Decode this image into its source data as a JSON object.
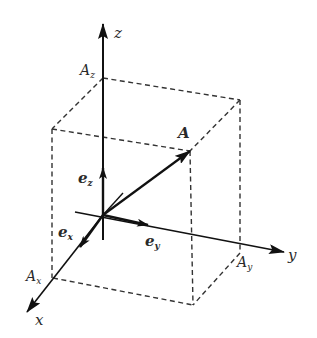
{
  "diagram": {
    "axes": {
      "x": {
        "label": "x"
      },
      "y": {
        "label": "y"
      },
      "z": {
        "label": "z"
      }
    },
    "components": {
      "Ax": {
        "main": "A",
        "sub": "x"
      },
      "Ay": {
        "main": "A",
        "sub": "y"
      },
      "Az": {
        "main": "A",
        "sub": "z"
      }
    },
    "vector": {
      "label": "A"
    },
    "unit_vectors": {
      "ex": {
        "main": "e",
        "sub": "x"
      },
      "ey": {
        "main": "e",
        "sub": "y"
      },
      "ez": {
        "main": "e",
        "sub": "z"
      }
    },
    "colors": {
      "line": "#111111",
      "dashed": "#333333",
      "text": "#2a2a2a"
    }
  }
}
